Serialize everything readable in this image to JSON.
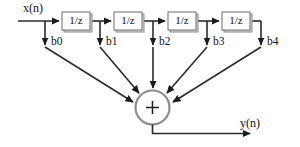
{
  "diagram": {
    "title_text": "",
    "type": "fir-filter-direct-form-block-diagram",
    "input_label": "x(n)",
    "output_label": "y(n)",
    "sum_symbol": "+",
    "delay_label": "1/z",
    "delay_blocks": [
      {
        "id": "z1",
        "label": "1/z"
      },
      {
        "id": "z2",
        "label": "1/z"
      },
      {
        "id": "z3",
        "label": "1/z"
      },
      {
        "id": "z4",
        "label": "1/z"
      }
    ],
    "taps": [
      {
        "id": "b0",
        "label": "b0"
      },
      {
        "id": "b1",
        "label": "b1"
      },
      {
        "id": "b2",
        "label": "b2"
      },
      {
        "id": "b3",
        "label": "b3"
      },
      {
        "id": "b4",
        "label": "b4"
      }
    ],
    "colors": {
      "background": "#ffffff",
      "wire": "#2b2b2b",
      "box_fill": "#fdfdfd",
      "box_border": "#6e6e6e",
      "box_shadow": "#d9d9d9",
      "circle_stroke": "#8d8d8d",
      "text": "#111111"
    }
  }
}
